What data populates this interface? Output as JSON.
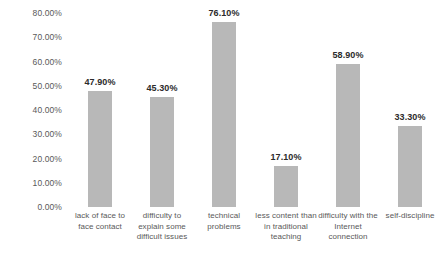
{
  "chart_data": {
    "type": "bar",
    "title": "",
    "subtitle": "",
    "xlabel": "",
    "ylabel": "",
    "ylim": [
      0,
      80
    ],
    "grid": false,
    "legend": false,
    "legend_position": "none",
    "bar_color": "#b8b8b8",
    "value_label_color": "#2b2b2b",
    "tick_label_color": "#595959",
    "y_ticks": [
      "0.00%",
      "10.00%",
      "20.00%",
      "30.00%",
      "40.00%",
      "50.00%",
      "60.00%",
      "70.00%",
      "80.00%"
    ],
    "y_tick_values": [
      0,
      10,
      20,
      30,
      40,
      50,
      60,
      70,
      80
    ],
    "categories": [
      "lack of face to face contact",
      "difficulty to explain some difficult issues",
      "technical problems",
      "less content than in traditional teaching",
      "difficulty with the Internet connection",
      "self-discipline"
    ],
    "values": [
      47.9,
      45.3,
      76.1,
      17.1,
      58.9,
      33.3
    ],
    "value_labels": [
      "47.90%",
      "45.30%",
      "76.10%",
      "17.10%",
      "58.90%",
      "33.30%"
    ]
  }
}
